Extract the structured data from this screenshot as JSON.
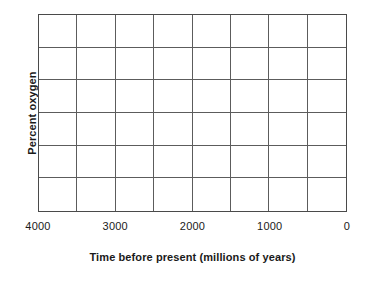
{
  "chart_data": {
    "type": "line",
    "title": "",
    "subtitle": "",
    "xlabel": "Time before present (millions of years)",
    "ylabel": "Percent oxygen",
    "x": [],
    "values": [],
    "series": [],
    "annotations": [],
    "legend": [],
    "legend_position": "none",
    "grid": true,
    "grid_columns": 8,
    "grid_rows": 6,
    "xlim": [
      4000,
      0
    ],
    "ylim": [
      null,
      null
    ],
    "x_tick_labels": [
      "4000",
      "3000",
      "2000",
      "1000",
      "0"
    ],
    "x_tick_values": [
      4000,
      3000,
      2000,
      1000,
      0
    ],
    "y_tick_labels": [],
    "x_axis_inverted": true,
    "note": "Empty plotting grid; no data series are drawn inside the axes."
  },
  "figure": {
    "x_axis": {
      "title": "Time before present (millions of years)",
      "ticks": [
        {
          "label": "4000",
          "value": 4000,
          "pos_pct": 0
        },
        {
          "label": "3000",
          "value": 3000,
          "pos_pct": 25
        },
        {
          "label": "2000",
          "value": 2000,
          "pos_pct": 50
        },
        {
          "label": "1000",
          "value": 1000,
          "pos_pct": 75
        },
        {
          "label": "0",
          "value": 0,
          "pos_pct": 100
        }
      ]
    },
    "y_axis": {
      "title": "Percent oxygen",
      "ticks": []
    },
    "colors": {
      "background": "#ffffff",
      "plot_background": "#ffffff",
      "axis_border": "#4a4a4a",
      "gridline": "#5c5c5c",
      "text": "#1a1a1a"
    }
  }
}
